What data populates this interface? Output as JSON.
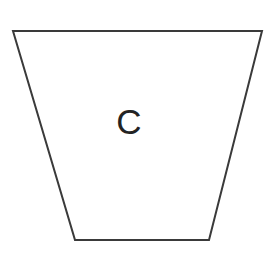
{
  "canvas": {
    "width": 273,
    "height": 263,
    "background_color": "#ffffff"
  },
  "figure": {
    "name": "trapezoid",
    "label": "C",
    "label_position": {
      "x": 129,
      "y": 134
    },
    "label_font_size": 35,
    "label_color": "#232323",
    "stroke_color": "#3a3a3a",
    "stroke_width": 2,
    "fill_color": "#ffffff",
    "points": "13,31 262,31 209,240 75,240",
    "vertices": [
      {
        "name": "top-left",
        "x": 13,
        "y": 31
      },
      {
        "name": "top-right",
        "x": 262,
        "y": 31
      },
      {
        "name": "bottom-right",
        "x": 209,
        "y": 240
      },
      {
        "name": "bottom-left",
        "x": 75,
        "y": 240
      }
    ],
    "top_width": 249,
    "bottom_width": 134,
    "height": 209
  }
}
